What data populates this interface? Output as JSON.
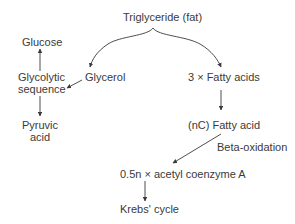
{
  "diagram": {
    "colors": {
      "text": "#3a3a3a",
      "line": "#3a3a3a",
      "background": "#ffffff"
    },
    "nodes": {
      "triglyceride": "Triglyceride (fat)",
      "glucose": "Glucose",
      "glycolytic_line1": "Glycolytic",
      "glycolytic_line2": "sequence",
      "glycerol": "Glycerol",
      "fatty_acids": "3 × Fatty acids",
      "pyruvic_line1": "Pyruvic",
      "pyruvic_line2": "acid",
      "nc_fatty_acid": "(nC) Fatty acid",
      "acetyl_coa": "0.5n × acetyl coenzyme A",
      "krebs": "Krebs' cycle"
    },
    "edge_labels": {
      "beta_oxidation": "Beta-oxidation"
    },
    "edges": [
      {
        "from": "triglyceride",
        "to": "glycerol"
      },
      {
        "from": "triglyceride",
        "to": "fatty_acids"
      },
      {
        "from": "glycerol",
        "to": "glycolytic"
      },
      {
        "from": "glycolytic",
        "to": "glucose"
      },
      {
        "from": "glycolytic",
        "to": "pyruvic"
      },
      {
        "from": "fatty_acids",
        "to": "nc_fatty_acid"
      },
      {
        "from": "nc_fatty_acid",
        "to": "acetyl_coa",
        "label": "beta_oxidation"
      },
      {
        "from": "acetyl_coa",
        "to": "krebs"
      }
    ]
  }
}
